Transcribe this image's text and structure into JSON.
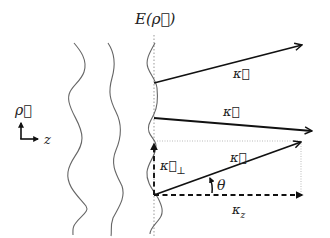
{
  "diagram": {
    "field_label": "E(ρ⃗)",
    "axes": {
      "rho_label": "ρ⃗",
      "z_label": "z"
    },
    "wavefronts": [
      {
        "name": "wavefront-1"
      },
      {
        "name": "wavefront-2"
      },
      {
        "name": "field-profile"
      }
    ],
    "vectors": [
      {
        "name": "kappa-vector-1",
        "label": "κ⃗"
      },
      {
        "name": "kappa-vector-2",
        "label": "κ⃗"
      },
      {
        "name": "kappa-vector-3",
        "label": "κ⃗"
      }
    ],
    "components": {
      "perp_label_main": "κ⃗",
      "perp_label_sub": "⊥",
      "z_label_main": "κ",
      "z_label_sub": "z"
    },
    "angle_label": "θ",
    "colors": {
      "vector": "#111111",
      "wave": "#666666",
      "guide": "#aaaaaa"
    }
  }
}
